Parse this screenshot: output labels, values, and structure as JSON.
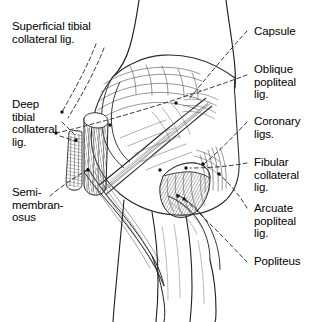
{
  "figure": {
    "view": "posterior",
    "background_color": "#ffffff",
    "ink_color": "#1a1a1a",
    "leader_line_style": "dashed"
  },
  "labels": {
    "superficial_tibial_collateral": "Superficial tibial\ncollateral lig.",
    "deep_tibial_collateral": "Deep\ntibial\ncollateral\nlig.",
    "semimembranosus": "Semi-\nmembran-\nosus",
    "capsule": "Capsule",
    "oblique_popliteal": "Oblique\npopliteal\nlig.",
    "coronary": "Coronary\nligs.",
    "fibular_collateral": "Fibular\ncollateral\nlig.",
    "arcuate_popliteal": "Arcuate\npopliteal\nlig.",
    "popliteus": "Popliteus"
  },
  "structures": [
    {
      "name": "Superficial tibial collateral lig.",
      "side": "left",
      "anchor": [
        62,
        112
      ]
    },
    {
      "name": "Deep tibial collateral lig.",
      "side": "left",
      "anchor": [
        76,
        140
      ]
    },
    {
      "name": "Semi-membranosus",
      "side": "left",
      "anchor": [
        88,
        171
      ]
    },
    {
      "name": "Capsule",
      "side": "right",
      "anchor": [
        176,
        103
      ]
    },
    {
      "name": "Oblique popliteal lig.",
      "side": "right",
      "anchor": [
        55,
        133
      ]
    },
    {
      "name": "Coronary ligs.",
      "side": "right",
      "anchor": [
        203,
        164
      ]
    },
    {
      "name": "Fibular collateral lig.",
      "side": "right",
      "anchor": [
        186,
        168
      ]
    },
    {
      "name": "Arcuate popliteal lig.",
      "side": "right",
      "anchor": [
        216,
        173
      ]
    },
    {
      "name": "Popliteus",
      "side": "right",
      "anchor": [
        181,
        196
      ]
    }
  ]
}
